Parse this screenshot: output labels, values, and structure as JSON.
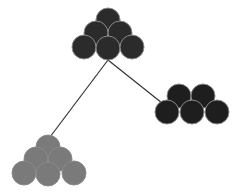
{
  "diagram": {
    "type": "tree",
    "colors": {
      "background": "#ffffff",
      "edge": "#333333",
      "circle_outline": "#8a8a8a"
    },
    "edges": [
      {
        "from": "root",
        "to": "left-child",
        "x1": 108,
        "y1": 60,
        "x2": 50,
        "y2": 137
      },
      {
        "from": "root",
        "to": "right-child",
        "x1": 108,
        "y1": 60,
        "x2": 162,
        "y2": 103
      }
    ],
    "clusters": [
      {
        "id": "root",
        "fill": "#2b2b2b",
        "radius": 12,
        "circles": [
          {
            "cx": 108,
            "cy": 20
          },
          {
            "cx": 96,
            "cy": 33
          },
          {
            "cx": 120,
            "cy": 33
          },
          {
            "cx": 84,
            "cy": 47
          },
          {
            "cx": 108,
            "cy": 48
          },
          {
            "cx": 132,
            "cy": 47
          }
        ]
      },
      {
        "id": "right-child",
        "fill": "#1e1e1e",
        "radius": 12,
        "circles": [
          {
            "cx": 179,
            "cy": 96
          },
          {
            "cx": 203,
            "cy": 96
          },
          {
            "cx": 167,
            "cy": 112
          },
          {
            "cx": 192,
            "cy": 112
          },
          {
            "cx": 217,
            "cy": 112
          }
        ]
      },
      {
        "id": "left-child",
        "fill": "#7a7a7a",
        "radius": 12,
        "circles": [
          {
            "cx": 48,
            "cy": 147
          },
          {
            "cx": 36,
            "cy": 159
          },
          {
            "cx": 60,
            "cy": 159
          },
          {
            "cx": 24,
            "cy": 173
          },
          {
            "cx": 48,
            "cy": 174
          },
          {
            "cx": 74,
            "cy": 173
          }
        ]
      }
    ]
  }
}
